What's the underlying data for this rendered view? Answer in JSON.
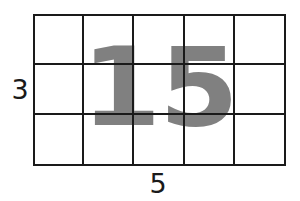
{
  "figure": {
    "type": "area-model-grid",
    "rows": 3,
    "columns": 5,
    "total_cells": 15,
    "grid_line_color": "#1a1a1a",
    "background_color": "#ffffff"
  },
  "labels": {
    "height_label": "3",
    "width_label": "5",
    "label_color": "#1a1a1a"
  },
  "overlay": {
    "number": "15",
    "color": "#808080"
  },
  "chart_data": {
    "type": "table",
    "title": "",
    "xlabel": "5",
    "ylabel": "3",
    "categories": [
      "columns",
      "rows"
    ],
    "values": [
      5,
      3
    ],
    "annotations": [
      "15"
    ]
  }
}
